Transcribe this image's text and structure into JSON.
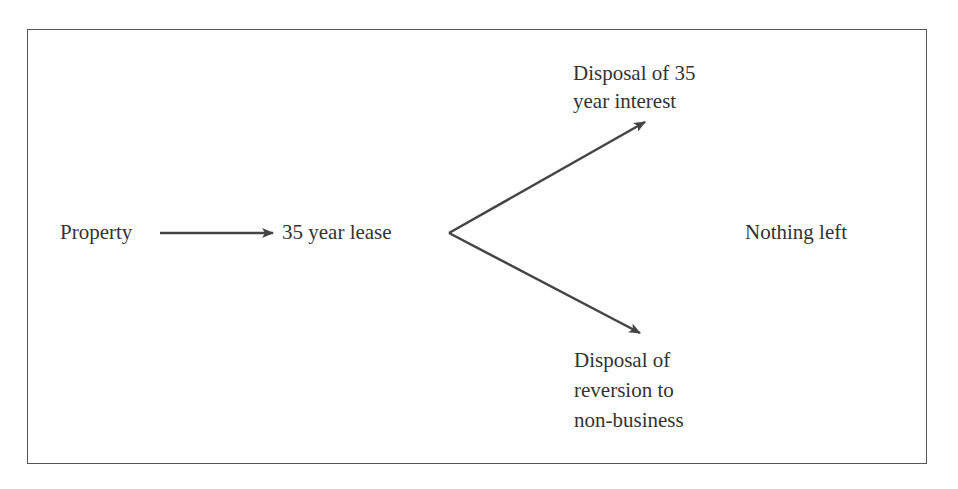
{
  "diagram": {
    "nodes": {
      "property": "Property",
      "lease": "35 year lease",
      "disposal_interest": {
        "line1": "Disposal of 35",
        "line2": "year interest"
      },
      "nothing_left": "Nothing left",
      "disposal_reversion": {
        "line1": "Disposal of",
        "line2": "reversion to",
        "line3": "non-business"
      }
    },
    "edges": [
      {
        "from": "property",
        "to": "lease"
      },
      {
        "from": "lease",
        "to": "disposal_interest"
      },
      {
        "from": "lease",
        "to": "disposal_reversion"
      }
    ],
    "colors": {
      "stroke": "#444444",
      "text": "#333333",
      "border": "#555555"
    }
  }
}
